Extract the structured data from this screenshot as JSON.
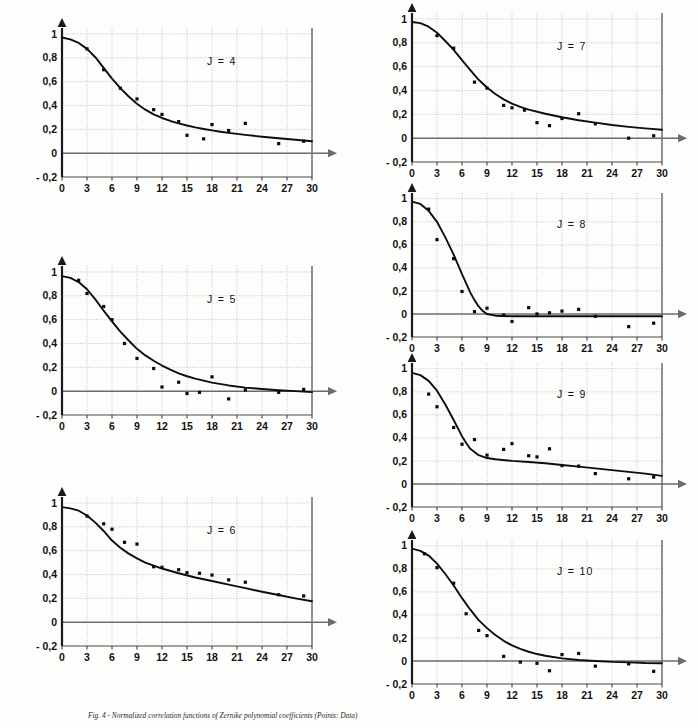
{
  "figure": {
    "caption": "Fig. 4 - Normalized correlation functions of Zernike polynomial coefficients (Points: Data)",
    "x_ticks": [
      "0",
      "3",
      "6",
      "9",
      "12",
      "15",
      "18",
      "21",
      "24",
      "27",
      "30"
    ],
    "y_ticks": [
      "1",
      "0,8",
      "0,6",
      "0,4",
      "0,2",
      "0",
      "- 0,2"
    ],
    "colors": {
      "curve": "#0d0d0d",
      "points": "#0b0b0b",
      "grid": "#9a9a9a",
      "axis": "#4a4a4a"
    }
  },
  "chart_data": [
    {
      "type": "scatter",
      "title": "J = 4",
      "panel_id": "j4",
      "xlabel": "",
      "ylabel": "",
      "xlim": [
        0,
        30
      ],
      "ylim": [
        -0.2,
        1.05
      ],
      "xticks": [
        0,
        3,
        6,
        9,
        12,
        15,
        18,
        21,
        24,
        27,
        30
      ],
      "yticks": [
        -0.2,
        0,
        0.2,
        0.4,
        0.6,
        0.8,
        1
      ],
      "grid": true,
      "legend": "none",
      "series": [
        {
          "name": "curve",
          "kind": "line",
          "x": [
            0,
            1,
            2,
            3,
            4,
            5,
            6,
            7,
            8,
            9,
            10,
            11,
            12,
            13,
            14,
            15,
            16,
            17,
            18,
            19,
            20,
            22,
            24,
            26,
            28,
            30
          ],
          "y": [
            0.97,
            0.955,
            0.925,
            0.875,
            0.805,
            0.715,
            0.625,
            0.545,
            0.475,
            0.415,
            0.365,
            0.325,
            0.295,
            0.27,
            0.25,
            0.232,
            0.216,
            0.203,
            0.191,
            0.18,
            0.17,
            0.153,
            0.138,
            0.125,
            0.113,
            0.1
          ]
        },
        {
          "name": "data",
          "kind": "points",
          "x": [
            3,
            5,
            7,
            9,
            11,
            12,
            14,
            15,
            17,
            18,
            20,
            22,
            26,
            29
          ],
          "y": [
            0.875,
            0.7,
            0.545,
            0.455,
            0.365,
            0.325,
            0.265,
            0.15,
            0.12,
            0.24,
            0.19,
            0.25,
            0.08,
            0.1
          ]
        }
      ]
    },
    {
      "type": "scatter",
      "title": "J = 5",
      "panel_id": "j5",
      "xlabel": "",
      "ylabel": "",
      "xlim": [
        0,
        30
      ],
      "ylim": [
        -0.2,
        1.05
      ],
      "xticks": [
        0,
        3,
        6,
        9,
        12,
        15,
        18,
        21,
        24,
        27,
        30
      ],
      "yticks": [
        -0.2,
        0,
        0.2,
        0.4,
        0.6,
        0.8,
        1
      ],
      "grid": true,
      "legend": "none",
      "series": [
        {
          "name": "curve",
          "kind": "line",
          "x": [
            0,
            1,
            2,
            3,
            4,
            5,
            6,
            7,
            8,
            9,
            10,
            11,
            12,
            13,
            14,
            15,
            16,
            18,
            20,
            22,
            24,
            26,
            28,
            30
          ],
          "y": [
            0.965,
            0.95,
            0.915,
            0.855,
            0.77,
            0.675,
            0.585,
            0.5,
            0.425,
            0.355,
            0.3,
            0.255,
            0.215,
            0.18,
            0.15,
            0.125,
            0.105,
            0.072,
            0.048,
            0.03,
            0.018,
            0.008,
            0.0,
            -0.008
          ]
        },
        {
          "name": "data",
          "kind": "points",
          "x": [
            2,
            3,
            5,
            6,
            7.5,
            9,
            11,
            12,
            14,
            15,
            16.5,
            20,
            22,
            26,
            29
          ],
          "y": [
            0.93,
            0.82,
            0.71,
            0.6,
            0.4,
            0.275,
            0.19,
            0.035,
            0.075,
            -0.02,
            -0.01,
            -0.065,
            0.01,
            -0.01,
            0.015
          ]
        },
        {
          "name": "data2",
          "kind": "points",
          "x": [
            18
          ],
          "y": [
            0.12
          ]
        }
      ]
    },
    {
      "type": "scatter",
      "title": "J = 6",
      "panel_id": "j6",
      "xlabel": "",
      "ylabel": "",
      "xlim": [
        0,
        30
      ],
      "ylim": [
        -0.2,
        1.05
      ],
      "xticks": [
        0,
        3,
        6,
        9,
        12,
        15,
        18,
        21,
        24,
        27,
        30
      ],
      "yticks": [
        -0.2,
        0,
        0.2,
        0.4,
        0.6,
        0.8,
        1
      ],
      "grid": true,
      "legend": "none",
      "series": [
        {
          "name": "curve",
          "kind": "line",
          "x": [
            0,
            1,
            2,
            3,
            4,
            5,
            6,
            7,
            8,
            9,
            10,
            12,
            14,
            16,
            18,
            20,
            22,
            24,
            26,
            28,
            30
          ],
          "y": [
            0.965,
            0.955,
            0.935,
            0.895,
            0.835,
            0.765,
            0.685,
            0.625,
            0.575,
            0.535,
            0.5,
            0.45,
            0.41,
            0.375,
            0.345,
            0.315,
            0.285,
            0.255,
            0.228,
            0.2,
            0.175
          ]
        },
        {
          "name": "data",
          "kind": "points",
          "x": [
            3,
            5,
            6,
            7.5,
            9,
            11,
            12,
            14,
            15,
            16.5,
            18,
            20,
            22,
            26,
            29
          ],
          "y": [
            0.89,
            0.825,
            0.78,
            0.67,
            0.655,
            0.465,
            0.46,
            0.44,
            0.415,
            0.41,
            0.395,
            0.355,
            0.335,
            0.23,
            0.22
          ]
        }
      ]
    },
    {
      "type": "scatter",
      "title": "J = 7",
      "panel_id": "j7",
      "xlabel": "",
      "ylabel": "",
      "xlim": [
        0,
        30
      ],
      "ylim": [
        -0.2,
        1.05
      ],
      "xticks": [
        0,
        3,
        6,
        9,
        12,
        15,
        18,
        21,
        24,
        27,
        30
      ],
      "yticks": [
        -0.2,
        0,
        0.2,
        0.4,
        0.6,
        0.8,
        1
      ],
      "grid": true,
      "legend": "none",
      "series": [
        {
          "name": "curve",
          "kind": "line",
          "x": [
            0,
            1,
            2,
            3,
            4,
            5,
            6,
            7,
            8,
            9,
            10,
            11,
            12,
            13,
            14,
            16,
            18,
            20,
            22,
            24,
            26,
            28,
            30
          ],
          "y": [
            0.975,
            0.965,
            0.935,
            0.885,
            0.815,
            0.74,
            0.655,
            0.57,
            0.49,
            0.425,
            0.37,
            0.325,
            0.29,
            0.262,
            0.24,
            0.205,
            0.175,
            0.15,
            0.13,
            0.11,
            0.095,
            0.082,
            0.07
          ]
        },
        {
          "name": "data",
          "kind": "points",
          "x": [
            3,
            5,
            7.5,
            9,
            11,
            12,
            13.5,
            15,
            16.5,
            18,
            20,
            22,
            26,
            29
          ],
          "y": [
            0.86,
            0.755,
            0.47,
            0.42,
            0.275,
            0.255,
            0.235,
            0.13,
            0.105,
            0.165,
            0.205,
            0.12,
            0.0,
            0.02
          ]
        }
      ]
    },
    {
      "type": "scatter",
      "title": "J = 8",
      "panel_id": "j8",
      "xlabel": "",
      "ylabel": "",
      "xlim": [
        0,
        30
      ],
      "ylim": [
        -0.2,
        1.05
      ],
      "xticks": [
        0,
        3,
        6,
        9,
        12,
        15,
        18,
        21,
        24,
        27,
        30
      ],
      "yticks": [
        -0.2,
        0,
        0.2,
        0.4,
        0.6,
        0.8,
        1
      ],
      "grid": true,
      "legend": "none",
      "series": [
        {
          "name": "curve",
          "kind": "line",
          "x": [
            0,
            1,
            2,
            3,
            4,
            5,
            6,
            6.5,
            7,
            7.5,
            8,
            8.5,
            9,
            10,
            12,
            15,
            18,
            21,
            24,
            27,
            30
          ],
          "y": [
            0.975,
            0.955,
            0.895,
            0.8,
            0.665,
            0.515,
            0.345,
            0.265,
            0.185,
            0.12,
            0.065,
            0.025,
            0.0,
            -0.015,
            -0.02,
            -0.02,
            -0.02,
            -0.02,
            -0.02,
            -0.02,
            -0.02
          ]
        },
        {
          "name": "data",
          "kind": "points",
          "x": [
            2,
            3,
            5,
            6,
            7.5,
            9,
            11,
            12,
            14,
            15,
            16.5,
            18,
            20,
            22,
            26,
            29
          ],
          "y": [
            0.91,
            0.645,
            0.48,
            0.195,
            0.02,
            0.05,
            -0.01,
            -0.065,
            0.055,
            0.0,
            0.01,
            0.025,
            0.04,
            -0.02,
            -0.11,
            -0.08
          ]
        }
      ]
    },
    {
      "type": "scatter",
      "title": "J = 9",
      "panel_id": "j9",
      "xlabel": "",
      "ylabel": "",
      "xlim": [
        0,
        30
      ],
      "ylim": [
        -0.2,
        1.05
      ],
      "xticks": [
        0,
        3,
        6,
        9,
        12,
        15,
        18,
        21,
        24,
        27,
        30
      ],
      "yticks": [
        -0.2,
        0,
        0.2,
        0.4,
        0.6,
        0.8,
        1
      ],
      "grid": true,
      "legend": "none",
      "series": [
        {
          "name": "curve",
          "kind": "line",
          "x": [
            0,
            1,
            2,
            3,
            4,
            5,
            6,
            6.5,
            7,
            8,
            9,
            10,
            12,
            14,
            16,
            18,
            20,
            22,
            24,
            26,
            28,
            30
          ],
          "y": [
            0.965,
            0.945,
            0.895,
            0.81,
            0.69,
            0.555,
            0.415,
            0.355,
            0.305,
            0.25,
            0.225,
            0.215,
            0.2,
            0.19,
            0.18,
            0.165,
            0.15,
            0.135,
            0.12,
            0.105,
            0.09,
            0.07
          ]
        },
        {
          "name": "data",
          "kind": "points",
          "x": [
            2,
            3,
            5,
            6,
            7.5,
            9,
            11,
            12,
            14,
            15,
            16.5,
            18,
            20,
            22,
            26,
            29
          ],
          "y": [
            0.78,
            0.67,
            0.49,
            0.345,
            0.385,
            0.25,
            0.3,
            0.35,
            0.245,
            0.235,
            0.305,
            0.16,
            0.155,
            0.09,
            0.045,
            0.06
          ]
        }
      ]
    },
    {
      "type": "scatter",
      "title": "J = 10",
      "panel_id": "j10",
      "xlabel": "",
      "ylabel": "",
      "xlim": [
        0,
        30
      ],
      "ylim": [
        -0.2,
        1.05
      ],
      "xticks": [
        0,
        3,
        6,
        9,
        12,
        15,
        18,
        21,
        24,
        27,
        30
      ],
      "yticks": [
        -0.2,
        0,
        0.2,
        0.4,
        0.6,
        0.8,
        1
      ],
      "grid": true,
      "legend": "none",
      "series": [
        {
          "name": "curve",
          "kind": "line",
          "x": [
            0,
            1,
            2,
            3,
            4,
            5,
            6,
            7,
            8,
            9,
            10,
            11,
            12,
            13,
            14,
            15,
            16,
            18,
            20,
            22,
            24,
            26,
            28,
            30
          ],
          "y": [
            0.975,
            0.955,
            0.915,
            0.845,
            0.755,
            0.655,
            0.545,
            0.445,
            0.355,
            0.285,
            0.225,
            0.175,
            0.135,
            0.105,
            0.08,
            0.06,
            0.045,
            0.022,
            0.008,
            0.0,
            -0.008,
            -0.012,
            -0.018,
            -0.02
          ]
        },
        {
          "name": "data",
          "kind": "points",
          "x": [
            1.5,
            3,
            5,
            6.5,
            8,
            9,
            11,
            13,
            15,
            16.5,
            18,
            20,
            22,
            26,
            29
          ],
          "y": [
            0.93,
            0.81,
            0.675,
            0.41,
            0.265,
            0.22,
            0.04,
            -0.01,
            -0.02,
            -0.085,
            0.055,
            0.065,
            -0.045,
            -0.025,
            -0.09
          ]
        }
      ]
    }
  ],
  "panels": {
    "j4": {
      "left": 28,
      "top": 18,
      "w": 310,
      "h": 185
    },
    "j5": {
      "left": 28,
      "top": 256,
      "w": 310,
      "h": 185
    },
    "j6": {
      "left": 28,
      "top": 487,
      "w": 310,
      "h": 185
    },
    "j7": {
      "left": 378,
      "top": 3,
      "w": 310,
      "h": 185
    },
    "j8": {
      "left": 378,
      "top": 183,
      "w": 310,
      "h": 180
    },
    "j9": {
      "left": 378,
      "top": 353,
      "w": 310,
      "h": 180
    },
    "j10": {
      "left": 378,
      "top": 530,
      "w": 310,
      "h": 180
    }
  }
}
